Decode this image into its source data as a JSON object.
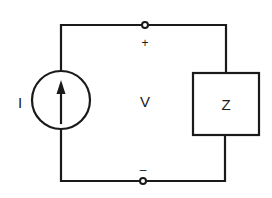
{
  "diagram": {
    "type": "circuit",
    "components": {
      "current_source": {
        "label": "I",
        "symbol": "circle-with-up-arrow"
      },
      "impedance": {
        "label": "Z"
      },
      "voltage": {
        "label": "V"
      }
    },
    "terminals": {
      "top_polarity": "+",
      "bottom_polarity": "–"
    },
    "colors": {
      "stroke": "#1a1a1a",
      "background": "#ffffff"
    }
  }
}
